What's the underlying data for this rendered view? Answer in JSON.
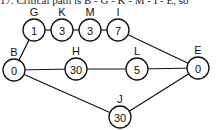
{
  "caption": "17. Critical path is B - G - K - M - I - E, so",
  "diagram": {
    "type": "network",
    "nodes": [
      {
        "id": "B",
        "label": "B",
        "value": "0",
        "x": 14,
        "y": 70
      },
      {
        "id": "G",
        "label": "G",
        "value": "1",
        "x": 34,
        "y": 30
      },
      {
        "id": "K",
        "label": "K",
        "value": "3",
        "x": 62,
        "y": 30
      },
      {
        "id": "M",
        "label": "M",
        "value": "3",
        "x": 90,
        "y": 30
      },
      {
        "id": "I",
        "label": "I",
        "value": "7",
        "x": 118,
        "y": 30
      },
      {
        "id": "H",
        "label": "H",
        "value": "30",
        "x": 76,
        "y": 69
      },
      {
        "id": "L",
        "label": "L",
        "value": "5",
        "x": 137,
        "y": 69
      },
      {
        "id": "E",
        "label": "E",
        "value": "0",
        "x": 198,
        "y": 68
      },
      {
        "id": "J",
        "label": "J",
        "value": "30",
        "x": 120,
        "y": 117
      }
    ],
    "edges": [
      [
        "B",
        "G"
      ],
      [
        "G",
        "K"
      ],
      [
        "K",
        "M"
      ],
      [
        "M",
        "I"
      ],
      [
        "I",
        "E"
      ],
      [
        "B",
        "H"
      ],
      [
        "H",
        "L"
      ],
      [
        "L",
        "E"
      ],
      [
        "B",
        "J"
      ],
      [
        "J",
        "E"
      ]
    ]
  }
}
